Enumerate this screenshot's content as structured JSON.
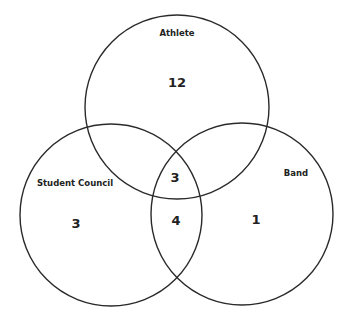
{
  "diagram": {
    "type": "venn",
    "sets": [
      {
        "id": "athlete",
        "label": "Athlete",
        "cx": 177,
        "cy": 107,
        "r": 92,
        "label_x": 177,
        "label_y": 36
      },
      {
        "id": "student_council",
        "label": "Student Council",
        "cx": 111,
        "cy": 215,
        "r": 91,
        "label_x": 75,
        "label_y": 186
      },
      {
        "id": "band",
        "label": "Band",
        "cx": 242,
        "cy": 214,
        "r": 91,
        "label_x": 296,
        "label_y": 176
      }
    ],
    "regions": [
      {
        "name": "athlete-only",
        "value": "12",
        "x": 177,
        "y": 87
      },
      {
        "name": "student-council-only",
        "value": "3",
        "x": 76,
        "y": 228
      },
      {
        "name": "band-only",
        "value": "1",
        "x": 256,
        "y": 224
      },
      {
        "name": "all-three",
        "value": "3",
        "x": 175,
        "y": 182
      },
      {
        "name": "student-council-and-band",
        "value": "4",
        "x": 176,
        "y": 225
      }
    ],
    "colors": {
      "stroke": "#2a2a2a",
      "text": "#222222",
      "background": "#ffffff"
    }
  }
}
